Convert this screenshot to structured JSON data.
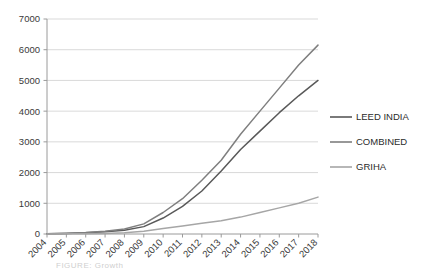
{
  "chart_data": {
    "type": "line",
    "title": "",
    "subtitle": "",
    "xlabel": "",
    "ylabel": "",
    "categories": [
      "2004",
      "2005",
      "2006",
      "2007",
      "2008",
      "2009",
      "2010",
      "2011",
      "2012",
      "2013",
      "2014",
      "2015",
      "2016",
      "2017",
      "2018"
    ],
    "ylim": [
      0,
      7000
    ],
    "ytick_values": [
      0,
      1000,
      2000,
      3000,
      4000,
      5000,
      6000,
      7000
    ],
    "ytick_labels": [
      "0",
      "1000",
      "2000",
      "3000",
      "4000",
      "5000",
      "6000",
      "7000"
    ],
    "grid": "horizontal",
    "legend_position": "right",
    "series": [
      {
        "name": "LEED INDIA",
        "color": "#595959",
        "values": [
          10,
          20,
          40,
          70,
          120,
          240,
          520,
          900,
          1400,
          2050,
          2750,
          3350,
          3950,
          4500,
          5000
        ]
      },
      {
        "name": "COMBINED",
        "color": "#7f7f7f",
        "values": [
          10,
          25,
          50,
          90,
          160,
          330,
          700,
          1150,
          1750,
          2400,
          3250,
          4000,
          4750,
          5500,
          6150
        ]
      },
      {
        "name": "GRIHA",
        "color": "#a6a6a6",
        "values": [
          0,
          5,
          10,
          20,
          40,
          90,
          180,
          260,
          350,
          430,
          550,
          700,
          850,
          1000,
          1200
        ]
      }
    ]
  },
  "legend": {
    "items": [
      {
        "label": "LEED INDIA"
      },
      {
        "label": "COMBINED"
      },
      {
        "label": "GRIHA"
      }
    ]
  },
  "caption": {
    "text": "FIGURE:  Growth"
  }
}
